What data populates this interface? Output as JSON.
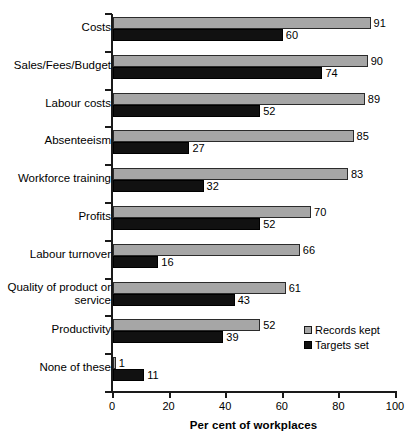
{
  "chart_data": {
    "type": "bar",
    "orientation": "horizontal",
    "title": "",
    "xlabel": "Per cent of workplaces",
    "ylabel": "",
    "xlim": [
      0,
      100
    ],
    "xticks": [
      0,
      20,
      40,
      60,
      80,
      100
    ],
    "xtick_labels": [
      "0",
      "20",
      "40",
      "60",
      "80",
      "100"
    ],
    "grid": false,
    "legend_position": "inside-right-lower",
    "categories": [
      "Costs",
      "Sales/Fees/Budget",
      "Labour costs",
      "Absenteeism",
      "Workforce training",
      "Profits",
      "Labour turnover",
      "Quality of product or service",
      "Productivity",
      "None of these"
    ],
    "series": [
      {
        "name": "Records kept",
        "color": "#a6a6a6",
        "values": [
          91,
          90,
          89,
          85,
          83,
          70,
          66,
          61,
          52,
          1
        ]
      },
      {
        "name": "Targets set",
        "color": "#111111",
        "values": [
          60,
          74,
          52,
          27,
          32,
          52,
          16,
          43,
          39,
          11
        ]
      }
    ]
  },
  "axis": {
    "x_title": "Per cent of workplaces",
    "ticks": [
      "0",
      "20",
      "40",
      "60",
      "80",
      "100"
    ]
  },
  "legend": {
    "items": [
      {
        "label": "Records kept",
        "swatch": "records"
      },
      {
        "label": "Targets set",
        "swatch": "targets"
      }
    ]
  },
  "categories": [
    {
      "label": "Costs",
      "label_line2": ""
    },
    {
      "label": "Sales/Fees/Budget",
      "label_line2": ""
    },
    {
      "label": "Labour costs",
      "label_line2": ""
    },
    {
      "label": "Absenteeism",
      "label_line2": ""
    },
    {
      "label": "Workforce training",
      "label_line2": ""
    },
    {
      "label": "Profits",
      "label_line2": ""
    },
    {
      "label": "Labour turnover",
      "label_line2": ""
    },
    {
      "label": "Quality of product or",
      "label_line2": "service"
    },
    {
      "label": "Productivity",
      "label_line2": ""
    },
    {
      "label": "None of these",
      "label_line2": ""
    }
  ],
  "values": {
    "records": [
      "91",
      "90",
      "89",
      "85",
      "83",
      "70",
      "66",
      "61",
      "52",
      "1"
    ],
    "targets": [
      "60",
      "74",
      "52",
      "27",
      "32",
      "52",
      "16",
      "43",
      "39",
      "11"
    ]
  }
}
